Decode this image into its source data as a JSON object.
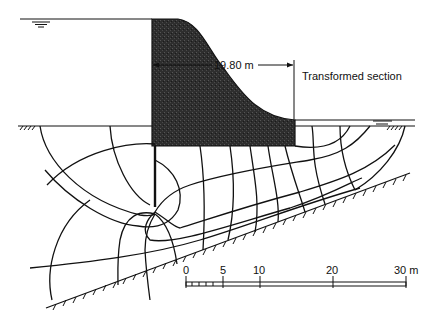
{
  "figure": {
    "dimension_label": "19.80 m",
    "section_label": "Transformed section",
    "scale_bar": {
      "ticks": [
        "0",
        "5",
        "10",
        "20",
        "30 m"
      ]
    },
    "symbols": {
      "upstream_water_level": "water-table-symbol",
      "downstream_water_level": "water-table-symbol",
      "ground_upstream": "ground-hatch-symbol",
      "ground_downstream": "ground-hatch-symbol",
      "impermeable_base": "inclined-hatched-boundary"
    },
    "colors": {
      "dam_fill": "#2a2a2a",
      "lines": "#111111",
      "background": "#ffffff"
    }
  }
}
